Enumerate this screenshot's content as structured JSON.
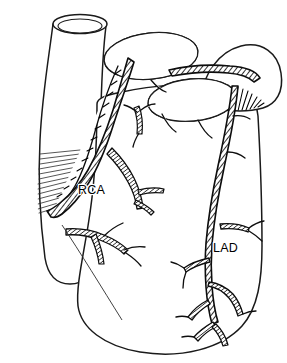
{
  "figure": {
    "view": "anterior",
    "style": "black-and-white line drawing with hatching and stippling",
    "background_color": "#ffffff",
    "ink_color": "#0d0d0d"
  },
  "labels": [
    {
      "id": "rca",
      "text": "RCA",
      "meaning": "right coronary artery",
      "x": 78,
      "y": 194
    },
    {
      "id": "lad",
      "text": "LAD",
      "meaning": "left anterior descending artery",
      "x": 213,
      "y": 252
    }
  ],
  "structures": [
    {
      "id": "great-vessel",
      "name": "great vessel trunk (aorta)",
      "has_elliptical_lumen_opening": true
    },
    {
      "id": "right-atrial-appendage",
      "name": "right atrial appendage",
      "texture": "stippled with hatched rim"
    },
    {
      "id": "left-atrial-appendage",
      "name": "left atrial appendage",
      "texture": "stippled with hatched rim"
    },
    {
      "id": "left-atrium-bulge",
      "name": "left atrium bulge",
      "texture": "fine hatching"
    },
    {
      "id": "ventricular-mass",
      "name": "ventricular mass",
      "texture": "plain outline"
    },
    {
      "id": "rca-trunk",
      "name": "right coronary artery trunk",
      "texture": "cross-hatched tube"
    },
    {
      "id": "lad-trunk",
      "name": "left anterior descending artery trunk",
      "texture": "cross-hatched tube"
    },
    {
      "id": "coronary-branches",
      "name": "coronary artery branches",
      "texture": "cross-hatched tubes"
    }
  ]
}
